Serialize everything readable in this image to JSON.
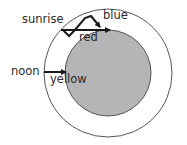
{
  "diagram": {
    "outer_circle": {
      "name": "atmosphere",
      "fill": "#ffffff",
      "stroke": "#555555"
    },
    "inner_circle": {
      "name": "earth",
      "fill": "#b5b5b5",
      "stroke": "#555555"
    },
    "labels": {
      "sunrise": "sunrise",
      "blue": "blue",
      "red": "red",
      "noon": "noon",
      "yellow": "yellow"
    },
    "arrows": [
      {
        "name": "sunrise-red-path",
        "description": "straight path from sunrise tangent to earth surface"
      },
      {
        "name": "sunrise-blue-scatter-path",
        "description": "zigzag scattered path toward blue"
      },
      {
        "name": "noon-yellow-path",
        "description": "short path from noon directly to earth surface"
      }
    ]
  }
}
